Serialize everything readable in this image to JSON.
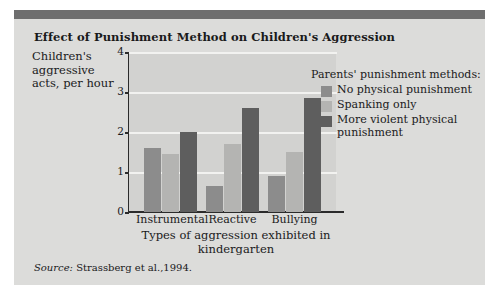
{
  "figure": {
    "title": "Effect of Punishment Method on Children's Aggression",
    "source_label": "Source:",
    "source_text": "Strassberg et al.,1994.",
    "accent_band_color": "#6e6e6e",
    "panel_color": "#dcdcda",
    "plot_color": "#d2d2d0"
  },
  "legend": {
    "title": "Parents' punishment methods:",
    "items": [
      {
        "label": "No physical punishment",
        "color": "#8c8c8c"
      },
      {
        "label": "Spanking only",
        "color": "#b4b4b2"
      },
      {
        "label": "More violent physical punishment",
        "color": "#5e5e5e"
      }
    ]
  },
  "axes": {
    "y_title": "Children's aggressive acts, per hour",
    "x_title": "Types of aggression exhibited in kindergarten",
    "y_ticks": [
      "0",
      "1",
      "2",
      "3",
      "4"
    ]
  },
  "chart_data": {
    "type": "bar",
    "title": "Effect of Punishment Method on Children's Aggression",
    "xlabel": "Types of aggression exhibited in kindergarten",
    "ylabel": "Children's aggressive acts, per hour",
    "ylim": [
      0,
      4
    ],
    "yticks": [
      0,
      1,
      2,
      3,
      4
    ],
    "grid": true,
    "legend_position": "right",
    "legend_title": "Parents' punishment methods:",
    "categories": [
      "Instrumental",
      "Reactive",
      "Bullying"
    ],
    "series": [
      {
        "name": "No physical punishment",
        "color": "#8c8c8c",
        "values": [
          1.6,
          0.65,
          0.9
        ]
      },
      {
        "name": "Spanking only",
        "color": "#b4b4b2",
        "values": [
          1.45,
          1.7,
          1.5
        ]
      },
      {
        "name": "More violent physical punishment",
        "color": "#5e5e5e",
        "values": [
          2.0,
          2.6,
          2.85
        ]
      }
    ]
  }
}
